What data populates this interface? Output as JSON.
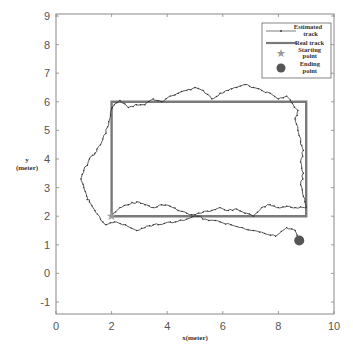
{
  "chart_data": {
    "type": "line",
    "title": "",
    "xlabel": "x(meter)",
    "ylabel": "y\n(meter)",
    "xlim": [
      0,
      10
    ],
    "ylim": [
      -1.4,
      9.2
    ],
    "xticks": [
      0,
      2,
      4,
      6,
      8,
      10
    ],
    "yticks": [
      -1,
      0,
      1,
      2,
      3,
      4,
      5,
      6,
      7,
      8,
      9
    ],
    "grid": false,
    "legend_position": "upper right",
    "legend": [
      "Estimated track",
      "Real track",
      "Starting point",
      "Ending point"
    ],
    "series": [
      {
        "name": "Real track",
        "style": "thick gray line",
        "x": [
          2,
          9,
          9,
          2,
          2
        ],
        "y": [
          2,
          2,
          6,
          6,
          2
        ]
      },
      {
        "name": "Estimated track",
        "style": "thin dark line with dot markers",
        "x": [
          2.0,
          2.3,
          2.6,
          2.9,
          3.2,
          3.5,
          3.8,
          4.1,
          4.4,
          4.7,
          5.0,
          5.3,
          5.6,
          5.9,
          6.2,
          6.5,
          6.8,
          7.1,
          7.4,
          7.7,
          8.0,
          8.3,
          8.6,
          9.0,
          8.9,
          8.8,
          8.9,
          8.8,
          8.9,
          8.8,
          8.7,
          8.6,
          8.7,
          8.5,
          8.3,
          8.0,
          7.7,
          7.4,
          7.1,
          6.8,
          6.5,
          6.2,
          5.9,
          5.6,
          5.3,
          5.0,
          4.7,
          4.4,
          4.1,
          3.8,
          3.5,
          3.2,
          2.9,
          2.6,
          2.3,
          2.1,
          2.0,
          1.9,
          1.8,
          1.6,
          1.4,
          1.2,
          1.0,
          0.9,
          1.0,
          1.1,
          1.2,
          1.4,
          1.6,
          1.8,
          2.1,
          2.5,
          2.9,
          3.2,
          3.5,
          3.9,
          4.3,
          4.7,
          5.1,
          5.5,
          5.9,
          6.3,
          6.7,
          7.1,
          7.5,
          7.9,
          8.3,
          8.6,
          8.75
        ],
        "y": [
          2.0,
          2.3,
          2.4,
          2.5,
          2.4,
          2.3,
          2.4,
          2.35,
          2.2,
          2.1,
          2.05,
          2.15,
          2.2,
          2.3,
          2.2,
          2.25,
          2.1,
          2.0,
          2.3,
          2.4,
          2.3,
          2.35,
          2.3,
          2.3,
          2.7,
          3.1,
          3.5,
          3.9,
          4.3,
          4.6,
          5.0,
          5.4,
          5.7,
          5.95,
          6.2,
          6.1,
          6.3,
          6.4,
          6.5,
          6.6,
          6.5,
          6.4,
          6.3,
          6.1,
          6.4,
          6.5,
          6.4,
          6.3,
          6.2,
          6.0,
          6.1,
          5.9,
          5.9,
          5.8,
          6.05,
          5.9,
          5.75,
          5.3,
          4.9,
          4.5,
          4.2,
          4.0,
          3.6,
          3.3,
          3.0,
          2.7,
          2.5,
          2.2,
          1.9,
          1.7,
          1.8,
          1.7,
          1.5,
          1.6,
          1.7,
          1.75,
          1.8,
          1.9,
          2.0,
          1.85,
          1.8,
          1.7,
          1.6,
          1.5,
          1.4,
          1.3,
          1.6,
          1.5,
          1.15
        ]
      },
      {
        "name": "Starting point",
        "marker": "star",
        "x": [
          2.0
        ],
        "y": [
          2.0
        ]
      },
      {
        "name": "Ending point",
        "marker": "circle",
        "x": [
          8.75
        ],
        "y": [
          1.15
        ]
      }
    ],
    "colors": {
      "real_track": "#7a7a7a",
      "estimated_track": "#333333",
      "start_marker": "#9a9a9a",
      "end_marker": "#555555",
      "axes": "#888888"
    }
  }
}
